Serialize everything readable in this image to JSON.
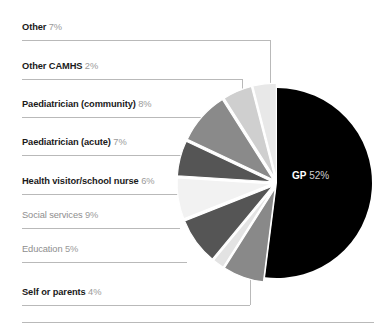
{
  "chart_data": {
    "type": "pie",
    "title": "",
    "categories": [
      "GP",
      "Other",
      "Other CAMHS",
      "Paediatrician (community)",
      "Paediatrician (acute)",
      "Health visitor/school nurse",
      "Social services",
      "Education",
      "Self or parents"
    ],
    "values": [
      52,
      7,
      2,
      8,
      7,
      6,
      9,
      5,
      4
    ],
    "value_suffix": "%",
    "slice_colors": [
      "#000000",
      "#898989",
      "#e3e3e3",
      "#555555",
      "#f2f2f2",
      "#555555",
      "#8a8a8a",
      "#cfcfcf",
      "#e8e8e8"
    ],
    "legend": "callout-labels-left",
    "exploded": true
  },
  "slices": {
    "gp": {
      "name": "GP",
      "pct": "52%"
    }
  },
  "labels": [
    {
      "name": "Other",
      "pct": "7%",
      "muted": false
    },
    {
      "name": "Other CAMHS",
      "pct": "2%",
      "muted": false
    },
    {
      "name": "Paediatrician (community)",
      "pct": "8%",
      "muted": false
    },
    {
      "name": "Paediatrician (acute)",
      "pct": "7%",
      "muted": false
    },
    {
      "name": "Health visitor/school nurse",
      "pct": "6%",
      "muted": false
    },
    {
      "name": "Social services",
      "pct": "9%",
      "muted": true
    },
    {
      "name": "Education",
      "pct": "5%",
      "muted": true
    },
    {
      "name": "Self or parents",
      "pct": "4%",
      "muted": false
    }
  ]
}
